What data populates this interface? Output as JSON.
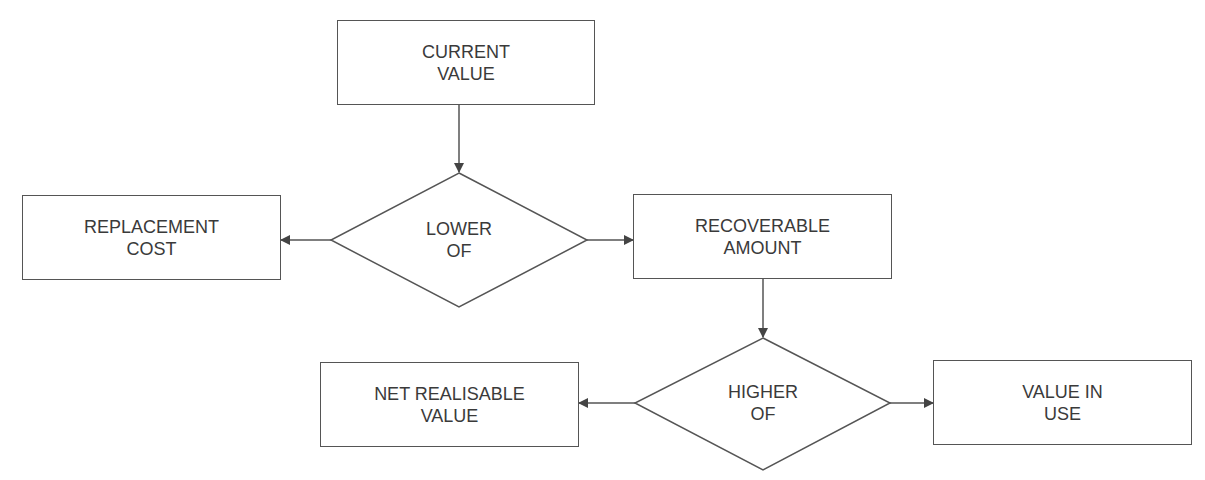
{
  "diagram": {
    "nodes": {
      "current_value": {
        "line1": "CURRENT",
        "line2": "VALUE"
      },
      "lower_of": {
        "line1": "LOWER",
        "line2": "OF"
      },
      "replacement_cost": {
        "line1": "REPLACEMENT",
        "line2": "COST"
      },
      "recoverable_amount": {
        "line1": "RECOVERABLE",
        "line2": "AMOUNT"
      },
      "higher_of": {
        "line1": "HIGHER",
        "line2": "OF"
      },
      "net_realisable_value": {
        "line1": "NET REALISABLE",
        "line2": "VALUE"
      },
      "value_in_use": {
        "line1": "VALUE IN",
        "line2": "USE"
      }
    },
    "edges": [
      {
        "from": "current_value",
        "to": "lower_of"
      },
      {
        "from": "lower_of",
        "to": "replacement_cost"
      },
      {
        "from": "lower_of",
        "to": "recoverable_amount"
      },
      {
        "from": "recoverable_amount",
        "to": "higher_of"
      },
      {
        "from": "higher_of",
        "to": "net_realisable_value"
      },
      {
        "from": "higher_of",
        "to": "value_in_use"
      }
    ],
    "colors": {
      "stroke": "#555555",
      "text": "#3a3a3a",
      "background": "#ffffff"
    }
  }
}
